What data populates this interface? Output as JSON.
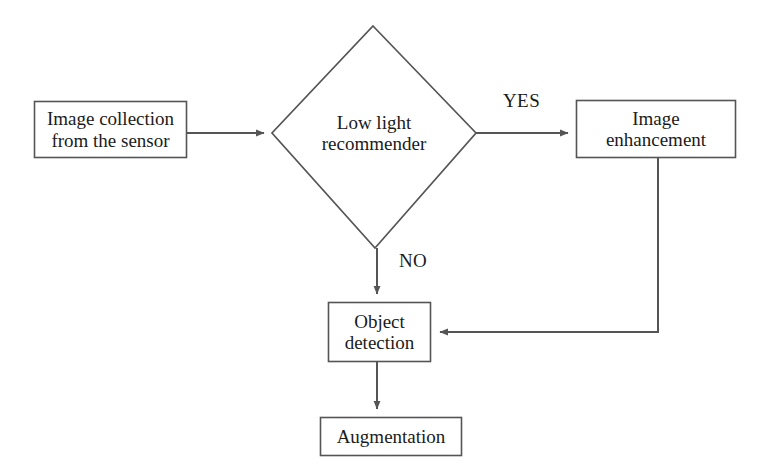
{
  "diagram": {
    "type": "flowchart",
    "title": "",
    "background_color": "#ffffff",
    "stroke_color": "#555555",
    "text_color": "#1b1b1b",
    "nodes": [
      {
        "id": "image-collection",
        "shape": "rectangle",
        "label_line1": "Image collection",
        "label_line2": "from the sensor",
        "x": 34,
        "y": 101,
        "w": 153,
        "h": 57
      },
      {
        "id": "low-light-recommender",
        "shape": "diamond",
        "label_line1": "Low light",
        "label_line2": "recommender",
        "x": 272,
        "y": 26,
        "w": 204,
        "h": 222
      },
      {
        "id": "image-enhancement",
        "shape": "rectangle",
        "label_line1": "Image",
        "label_line2": "enhancement",
        "x": 576,
        "y": 100,
        "w": 160,
        "h": 58
      },
      {
        "id": "object-detection",
        "shape": "rectangle",
        "label_line1": "Object",
        "label_line2": "detection",
        "x": 328,
        "y": 302,
        "w": 103,
        "h": 60
      },
      {
        "id": "augmentation",
        "shape": "rectangle",
        "label_line1": "Augmentation",
        "label_line2": "",
        "x": 320,
        "y": 417,
        "w": 142,
        "h": 39
      }
    ],
    "edges": [
      {
        "id": "edge-collection-to-decision",
        "from": "image-collection",
        "to": "low-light-recommender",
        "label": "",
        "arrow": true
      },
      {
        "id": "edge-decision-yes-to-enhancement",
        "from": "low-light-recommender",
        "to": "image-enhancement",
        "label": "YES",
        "label_x": 503,
        "label_y": 90,
        "arrow": true
      },
      {
        "id": "edge-decision-no-to-detection",
        "from": "low-light-recommender",
        "to": "object-detection",
        "label": "NO",
        "label_x": 399,
        "label_y": 250,
        "arrow": true
      },
      {
        "id": "edge-enhancement-to-detection",
        "from": "image-enhancement",
        "to": "object-detection",
        "label": "",
        "arrow": true
      },
      {
        "id": "edge-detection-to-augmentation",
        "from": "object-detection",
        "to": "augmentation",
        "label": "",
        "arrow": true
      }
    ]
  }
}
